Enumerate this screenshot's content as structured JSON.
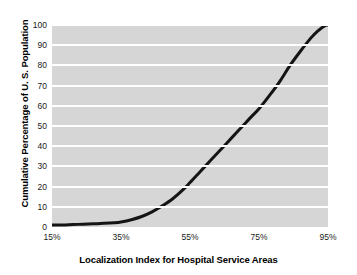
{
  "chart_data": {
    "type": "line",
    "title": "",
    "xlabel": "Localization Index for Hospital Service Areas",
    "ylabel": "Cumulative Percentage of U. S. Population",
    "xlim": [
      15,
      95
    ],
    "ylim": [
      0,
      100
    ],
    "grid": true,
    "legend": "none",
    "xticks": [
      "15%",
      "35%",
      "55%",
      "75%",
      "95%"
    ],
    "xtick_values": [
      15,
      35,
      55,
      75,
      95
    ],
    "yticks": [
      "0",
      "10",
      "20",
      "30",
      "40",
      "50",
      "60",
      "70",
      "80",
      "90",
      "100"
    ],
    "ytick_values": [
      0,
      10,
      20,
      30,
      40,
      50,
      60,
      70,
      80,
      90,
      100
    ],
    "series": [
      {
        "name": "Cumulative percentage of U.S. population",
        "color": "#141414",
        "x": [
          15,
          18,
          21,
          24,
          27,
          30,
          33,
          35,
          38,
          41,
          44,
          47,
          50,
          53,
          55,
          58,
          61,
          64,
          67,
          70,
          73,
          75,
          78,
          81,
          84,
          87,
          90,
          92,
          94,
          95
        ],
        "y": [
          1,
          1,
          1.2,
          1.4,
          1.6,
          1.8,
          2.1,
          2.5,
          3.6,
          5.2,
          7.5,
          10.5,
          14,
          18.5,
          22,
          27.5,
          33,
          38.5,
          44,
          49.5,
          55,
          58.5,
          65,
          72,
          80,
          87,
          93.5,
          97,
          99.5,
          100
        ]
      }
    ],
    "plot_bg_color": "#d6d6d6",
    "gridline_color": "#ffffff",
    "figure_bg_color": "#ffffff",
    "line_width_px": 3
  }
}
